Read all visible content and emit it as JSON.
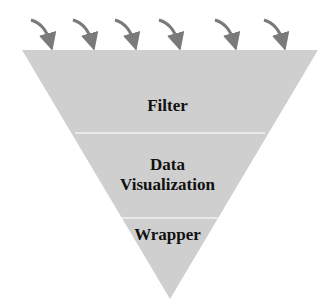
{
  "diagram": {
    "type": "inverted-funnel",
    "fill_color": "#cfcfcf",
    "arrow_color": "#7a7a7a",
    "arrow_count": 6,
    "layers": [
      {
        "label": "Filter"
      },
      {
        "label_line1": "Data",
        "label_line2": "Visualization"
      },
      {
        "label": "Wrapper"
      }
    ]
  }
}
